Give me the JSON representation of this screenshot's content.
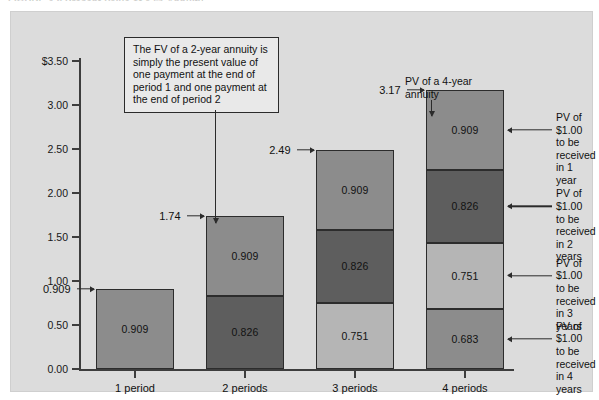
{
  "figure": {
    "title": "FIGURE 4-8   Present Value of a $1 Annuity",
    "panel_bg": "#dcdcdc"
  },
  "note_box": {
    "text": "The FV of a 2-year annuity is simply the present value of one payment at the end of period 1 and one payment at the end of period 2"
  },
  "annuity_note": {
    "text": "PV of a 4-year\nannuity"
  },
  "side_notes": [
    {
      "text": "PV of $1.00\nto be received\nin 1 year"
    },
    {
      "text": "PV of $1.00\nto be received\nin 2 years"
    },
    {
      "text": "PV of $1.00\nto be received\nin 3 years"
    },
    {
      "text": "PV of $1.00\nto be received\nin 4 years"
    }
  ],
  "chart_data": {
    "type": "bar",
    "title": "Present Value of a $1 Annuity",
    "xlabel": "",
    "ylabel": "",
    "stacked": true,
    "grid": false,
    "legend_position": "right-annotations",
    "ylim": [
      0.0,
      3.5
    ],
    "yticks": [
      0.0,
      0.5,
      1.0,
      1.5,
      2.0,
      2.5,
      3.0,
      3.5
    ],
    "ytick_labels": [
      "0.00",
      "0.50",
      "1.00",
      "1.50",
      "2.00",
      "2.50",
      "3.00",
      "$3.50"
    ],
    "categories": [
      "1 period",
      "2 periods",
      "3 periods",
      "4 periods"
    ],
    "series": [
      {
        "name": "PV of $1.00 to be received in 4 years",
        "values": [
          null,
          null,
          null,
          0.683
        ],
        "color": "#8c8c8c"
      },
      {
        "name": "PV of $1.00 to be received in 3 years",
        "values": [
          null,
          null,
          0.751,
          0.751
        ],
        "color": "#b5b5b5"
      },
      {
        "name": "PV of $1.00 to be received in 2 years",
        "values": [
          null,
          0.826,
          0.826,
          0.826
        ],
        "color": "#5e5e5e"
      },
      {
        "name": "PV of $1.00 to be received in 1 year",
        "values": [
          0.909,
          0.909,
          0.909,
          0.909
        ],
        "color": "#8c8c8c"
      }
    ],
    "totals": [
      0.909,
      1.74,
      2.49,
      3.17
    ],
    "total_labels": [
      "0.909",
      "1.74",
      "2.49",
      "3.17"
    ],
    "bars": [
      {
        "category": "1 period",
        "total": 0.909,
        "total_label": "0.909",
        "segments": [
          {
            "label": "0.909",
            "value": 0.909,
            "color": "#8c8c8c"
          }
        ]
      },
      {
        "category": "2 periods",
        "total": 1.74,
        "total_label": "1.74",
        "segments": [
          {
            "label": "0.909",
            "value": 0.909,
            "color": "#8c8c8c"
          },
          {
            "label": "0.826",
            "value": 0.826,
            "color": "#5e5e5e"
          }
        ]
      },
      {
        "category": "3 periods",
        "total": 2.49,
        "total_label": "2.49",
        "segments": [
          {
            "label": "0.909",
            "value": 0.909,
            "color": "#8c8c8c"
          },
          {
            "label": "0.826",
            "value": 0.826,
            "color": "#5e5e5e"
          },
          {
            "label": "0.751",
            "value": 0.751,
            "color": "#b5b5b5"
          }
        ]
      },
      {
        "category": "4 periods",
        "total": 3.17,
        "total_label": "3.17",
        "segments": [
          {
            "label": "0.909",
            "value": 0.909,
            "color": "#8c8c8c"
          },
          {
            "label": "0.826",
            "value": 0.826,
            "color": "#5e5e5e"
          },
          {
            "label": "0.751",
            "value": 0.751,
            "color": "#b5b5b5"
          },
          {
            "label": "0.683",
            "value": 0.683,
            "color": "#8c8c8c"
          }
        ]
      }
    ]
  }
}
